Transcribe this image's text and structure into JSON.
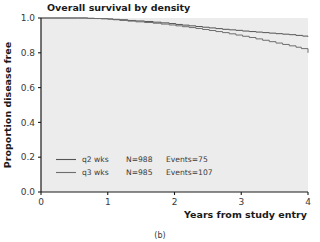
{
  "figure": {
    "caption": "(b)",
    "background": "#ffffff"
  },
  "chart_data": {
    "type": "line",
    "title": "Overall survival by density",
    "xlabel": "Years from study entry",
    "ylabel": "Proportion disease free",
    "xlim": [
      0,
      4
    ],
    "ylim": [
      0.0,
      1.0
    ],
    "xticks": [
      0,
      1,
      2,
      3,
      4
    ],
    "xtick_labels": [
      "0",
      "1",
      "2",
      "3",
      "4"
    ],
    "yticks": [
      0.0,
      0.2,
      0.4,
      0.6,
      0.8,
      1.0
    ],
    "ytick_labels": [
      "0.0",
      "0.2",
      "0.4",
      "0.6",
      "0.8",
      "1.0"
    ],
    "grid": false,
    "legend_position": "lower-left",
    "plot_background": "#ececec",
    "series": [
      {
        "name": "q2 wks",
        "label": "q2 wks",
        "n_label": "N=988",
        "events_label": "Events=75",
        "n": 988,
        "events": 75,
        "color": "#555555",
        "x": [
          0.0,
          0.55,
          0.7,
          0.8,
          0.9,
          1.0,
          1.08,
          1.18,
          1.3,
          1.42,
          1.55,
          1.68,
          1.8,
          1.92,
          2.02,
          2.12,
          2.22,
          2.32,
          2.42,
          2.52,
          2.62,
          2.72,
          2.82,
          2.92,
          3.02,
          3.12,
          3.22,
          3.32,
          3.42,
          3.52,
          3.62,
          3.72,
          3.82,
          3.92,
          4.0
        ],
        "y": [
          1.0,
          1.0,
          0.998,
          0.997,
          0.996,
          0.994,
          0.992,
          0.99,
          0.986,
          0.983,
          0.98,
          0.976,
          0.972,
          0.968,
          0.963,
          0.959,
          0.955,
          0.951,
          0.947,
          0.943,
          0.939,
          0.935,
          0.932,
          0.929,
          0.925,
          0.922,
          0.919,
          0.916,
          0.913,
          0.91,
          0.907,
          0.904,
          0.9,
          0.896,
          0.893
        ]
      },
      {
        "name": "q3 wks",
        "label": "q3 wks",
        "n_label": "N=985",
        "events_label": "Events=107",
        "n": 985,
        "events": 107,
        "color": "#6e6e6e",
        "x": [
          0.0,
          0.55,
          0.7,
          0.8,
          0.9,
          1.0,
          1.08,
          1.18,
          1.3,
          1.42,
          1.55,
          1.68,
          1.8,
          1.92,
          2.02,
          2.12,
          2.22,
          2.32,
          2.42,
          2.52,
          2.62,
          2.72,
          2.82,
          2.92,
          3.02,
          3.12,
          3.22,
          3.32,
          3.42,
          3.52,
          3.62,
          3.72,
          3.82,
          3.9,
          4.0
        ],
        "y": [
          1.0,
          1.0,
          0.998,
          0.997,
          0.996,
          0.994,
          0.99,
          0.986,
          0.982,
          0.978,
          0.974,
          0.97,
          0.965,
          0.96,
          0.955,
          0.95,
          0.945,
          0.94,
          0.934,
          0.928,
          0.922,
          0.916,
          0.909,
          0.902,
          0.895,
          0.888,
          0.88,
          0.872,
          0.864,
          0.856,
          0.848,
          0.84,
          0.832,
          0.824,
          0.8
        ]
      }
    ]
  }
}
